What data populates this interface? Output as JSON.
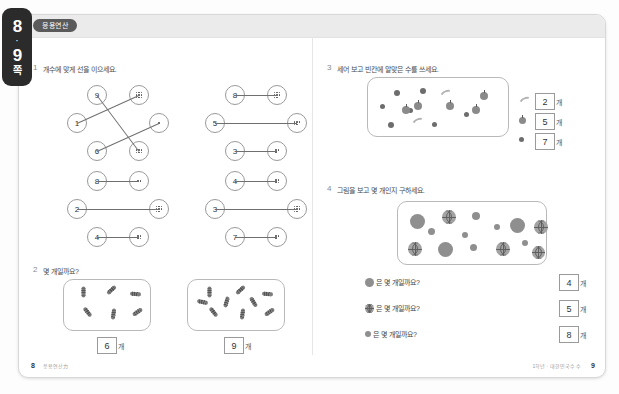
{
  "side_tab": {
    "page_a": "8",
    "separator": "·",
    "page_b": "9",
    "unit_label": "쪽"
  },
  "header": {
    "chip_label": "응용연산"
  },
  "problems": [
    {
      "number": "1",
      "title": "개수에 맞게 선을 이으세요."
    },
    {
      "number": "2",
      "title": "몇 개일까요?"
    },
    {
      "number": "3",
      "title": "세어 보고 빈칸에 알맞은 수를 쓰세요."
    },
    {
      "number": "4",
      "title": "그림을 보고 몇 개인지 구하세요."
    }
  ],
  "problem1": {
    "clusters": [
      {
        "numbers": [
          "9",
          "1",
          "6"
        ],
        "dot_counts": [
          9,
          1,
          6
        ]
      },
      {
        "numbers": [
          "8",
          "5",
          "3"
        ],
        "dot_counts": [
          8,
          5,
          3
        ]
      },
      {
        "numbers": [
          "8",
          "2",
          "4"
        ],
        "dot_counts": [
          2,
          8,
          4
        ]
      },
      {
        "numbers": [
          "4",
          "3",
          "7"
        ],
        "dot_counts": [
          4,
          8,
          3
        ]
      }
    ]
  },
  "problem2": {
    "boxes": [
      {
        "count": 6,
        "answer": "6",
        "unit": "개"
      },
      {
        "count": 9,
        "answer": "9",
        "unit": "개"
      }
    ]
  },
  "problem3": {
    "legend": [
      {
        "icon": "banana-icon",
        "answer": "2",
        "unit": "개"
      },
      {
        "icon": "apple-icon",
        "answer": "5",
        "unit": "개"
      },
      {
        "icon": "berry-icon",
        "answer": "7",
        "unit": "개"
      }
    ]
  },
  "problem4": {
    "questions": [
      {
        "icon": "plain-ball-icon",
        "text": "은 몇 개일까요?",
        "answer": "4",
        "unit": "개"
      },
      {
        "icon": "basketball-icon",
        "text": "은 몇 개일까요?",
        "answer": "5",
        "unit": "개"
      },
      {
        "icon": "small-ball-icon",
        "text": "은 몇 개일까요?",
        "answer": "8",
        "unit": "개"
      }
    ]
  },
  "footer": {
    "left_page": "8",
    "left_meta": "응용연산力",
    "right_meta": "1학년 · 대한민국수 수",
    "right_page": "9"
  }
}
